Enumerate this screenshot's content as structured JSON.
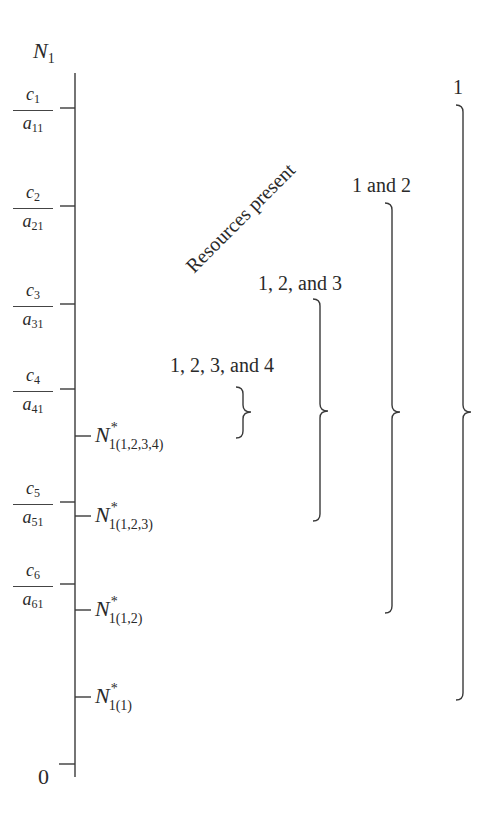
{
  "axis": {
    "label_main": "N",
    "label_sub": "1",
    "zero_label": "0",
    "x": 75,
    "y_top": 73,
    "y_bottom": 777
  },
  "ticks_left": [
    {
      "num": "c",
      "num_sub": "1",
      "den": "a",
      "den_sub": "11",
      "y": 108
    },
    {
      "num": "c",
      "num_sub": "2",
      "den": "a",
      "den_sub": "21",
      "y": 206
    },
    {
      "num": "c",
      "num_sub": "3",
      "den": "a",
      "den_sub": "31",
      "y": 304
    },
    {
      "num": "c",
      "num_sub": "4",
      "den": "a",
      "den_sub": "41",
      "y": 389
    },
    {
      "num": "c",
      "num_sub": "5",
      "den": "a",
      "den_sub": "51",
      "y": 502
    },
    {
      "num": "c",
      "num_sub": "6",
      "den": "a",
      "den_sub": "61",
      "y": 584
    }
  ],
  "ticks_right": [
    {
      "main": "N",
      "sup": "*",
      "sub": "1(1,2,3,4)",
      "y": 436
    },
    {
      "main": "N",
      "sup": "*",
      "sub": "1(1,2,3)",
      "y": 516
    },
    {
      "main": "N",
      "sup": "*",
      "sub": "1(1,2)",
      "y": 610
    },
    {
      "main": "N",
      "sup": "*",
      "sub": "1(1)",
      "y": 697
    }
  ],
  "rotated_title": "Resources present",
  "groups": [
    {
      "label": "1, 2, 3, and 4",
      "label_x": 170,
      "label_y": 355,
      "brace_x": 243,
      "top": 387,
      "bottom": 438,
      "mid": 412
    },
    {
      "label": "1, 2, and 3",
      "label_x": 258,
      "label_y": 273,
      "brace_x": 320,
      "top": 299,
      "bottom": 521,
      "mid": 411
    },
    {
      "label": "1 and 2",
      "label_x": 352,
      "label_y": 175,
      "brace_x": 392,
      "top": 203,
      "bottom": 613,
      "mid": 412
    },
    {
      "label": "1",
      "label_x": 453,
      "label_y": 77,
      "brace_x": 463,
      "top": 105,
      "bottom": 700,
      "mid": 412
    }
  ],
  "colors": {
    "ink": "#3a3a3a",
    "background": "#ffffff"
  }
}
